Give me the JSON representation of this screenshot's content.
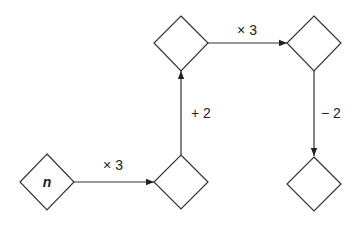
{
  "diagram": {
    "nodes": [
      {
        "id": "start",
        "label": "n"
      },
      {
        "id": "box2",
        "label": ""
      },
      {
        "id": "box3",
        "label": ""
      },
      {
        "id": "box4",
        "label": ""
      },
      {
        "id": "box5",
        "label": ""
      }
    ],
    "edges": [
      {
        "from": "start",
        "to": "box2",
        "label": "× 3"
      },
      {
        "from": "box2",
        "to": "box3",
        "label": "+ 2"
      },
      {
        "from": "box3",
        "to": "box4",
        "label": "× 3"
      },
      {
        "from": "box4",
        "to": "box5",
        "label": "− 2"
      }
    ],
    "colors": {
      "stroke": "#333333",
      "background": "#ffffff"
    }
  }
}
